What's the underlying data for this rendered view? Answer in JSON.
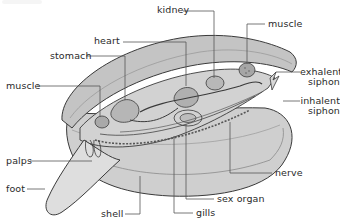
{
  "diagram": {
    "colors": {
      "shell_outer": "#bdbdbd",
      "shell_inner": "#d6d6d6",
      "shell_rim": "#a8a8a8",
      "body": "#c9c9c9",
      "foot": "#dcdcdc",
      "organ_dark": "#9e9e9e",
      "outline": "#3a3a3a",
      "leader_line": "#555555",
      "label_text": "#2a2a2a",
      "background": "#ffffff"
    },
    "labels": [
      {
        "id": "kidney",
        "text": "kidney"
      },
      {
        "id": "muscle-top",
        "text": "muscle"
      },
      {
        "id": "heart",
        "text": "heart"
      },
      {
        "id": "stomach",
        "text": "stomach"
      },
      {
        "id": "muscle-left",
        "text": "muscle"
      },
      {
        "id": "exhalent-siphon",
        "line1": "exhalent",
        "line2": "siphon"
      },
      {
        "id": "inhalent-siphon",
        "line1": "inhalent",
        "line2": "siphon"
      },
      {
        "id": "palps",
        "text": "palps"
      },
      {
        "id": "foot",
        "text": "foot"
      },
      {
        "id": "nerve",
        "text": "nerve"
      },
      {
        "id": "sex-organ",
        "text": "sex organ"
      },
      {
        "id": "shell",
        "text": "shell"
      },
      {
        "id": "gills",
        "text": "gills"
      }
    ]
  }
}
